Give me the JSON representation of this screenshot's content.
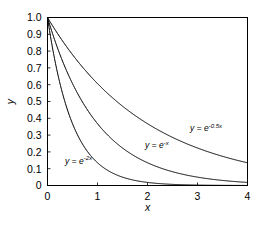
{
  "chart_data": {
    "type": "line",
    "title": "",
    "subtitle": "",
    "xlabel": "x",
    "ylabel": "y",
    "xlim": [
      0,
      4
    ],
    "ylim": [
      0,
      1.0
    ],
    "grid": false,
    "legend_position": "inline-annotations",
    "xticks": [
      "0",
      "1",
      "2",
      "3",
      "4"
    ],
    "xtick_values": [
      0,
      1,
      2,
      3,
      4
    ],
    "yticks": [
      "0",
      "0.1",
      "0.2",
      "0.3",
      "0.4",
      "0.5",
      "0.6",
      "0.7",
      "0.8",
      "0.9",
      "1.0"
    ],
    "ytick_values": [
      0,
      0.1,
      0.2,
      0.3,
      0.4,
      0.5,
      0.6,
      0.7,
      0.8,
      0.9,
      1.0
    ],
    "x": [
      0,
      0.2,
      0.4,
      0.6,
      0.8,
      1.0,
      1.2,
      1.4,
      1.6,
      1.8,
      2.0,
      2.2,
      2.4,
      2.6,
      2.8,
      3.0,
      3.2,
      3.4,
      3.6,
      3.8,
      4.0
    ],
    "series": [
      {
        "name": "y = e^{-0.5x}",
        "decay_rate": 0.5,
        "color": "#000000",
        "values": [
          1.0,
          0.905,
          0.819,
          0.741,
          0.67,
          0.607,
          0.549,
          0.497,
          0.449,
          0.407,
          0.368,
          0.333,
          0.301,
          0.273,
          0.247,
          0.223,
          0.202,
          0.183,
          0.165,
          0.15,
          0.135
        ]
      },
      {
        "name": "y = e^{-x}",
        "decay_rate": 1.0,
        "color": "#000000",
        "values": [
          1.0,
          0.819,
          0.67,
          0.549,
          0.449,
          0.368,
          0.301,
          0.247,
          0.202,
          0.165,
          0.135,
          0.111,
          0.091,
          0.074,
          0.061,
          0.05,
          0.041,
          0.033,
          0.027,
          0.022,
          0.018
        ]
      },
      {
        "name": "y = e^{-2x}",
        "decay_rate": 2.0,
        "color": "#000000",
        "values": [
          1.0,
          0.67,
          0.449,
          0.301,
          0.202,
          0.135,
          0.091,
          0.061,
          0.041,
          0.027,
          0.018,
          0.012,
          0.008,
          0.006,
          0.004,
          0.002,
          0.002,
          0.001,
          0.001,
          0.0,
          0.0
        ]
      }
    ],
    "annotations": [
      {
        "id": "label-exp-half",
        "base": "y = e",
        "exponent": "-0.5x",
        "x_data": 2.85,
        "y_data": 0.325
      },
      {
        "id": "label-exp-one",
        "base": "y = e",
        "exponent": "-x",
        "x_data": 1.95,
        "y_data": 0.225
      },
      {
        "id": "label-exp-two",
        "base": "y = e",
        "exponent": "-2x",
        "x_data": 0.35,
        "y_data": 0.13
      }
    ]
  }
}
